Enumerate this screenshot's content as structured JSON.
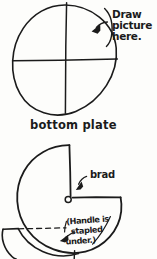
{
  "document": {
    "kind": "hand-drawn-craft-instruction-diagram",
    "background_color": "#fdfdfb",
    "ink_color": "#1b1b1b"
  },
  "top_figure": {
    "name": "bottom-plate",
    "caption": "bottom plate",
    "annotation": {
      "line1": "Draw",
      "line2": "picture",
      "line3": "here."
    },
    "shape": "circle-with-crosshair",
    "divider_count": 4
  },
  "bottom_figure": {
    "name": "top-plate-with-window",
    "shape": "circle-with-pie-wedge-cutout",
    "brad_label": "brad",
    "note": {
      "line1": "(Handle is",
      "line2": "stapled",
      "line3": "under.)"
    },
    "handle_label": "handle"
  }
}
